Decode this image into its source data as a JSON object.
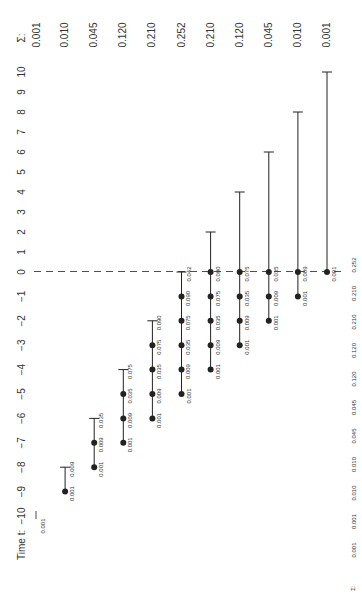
{
  "chart_data": {
    "type": "diagram",
    "title": "",
    "orientation": "rotated-90-ccw",
    "time_axis": {
      "label": "Time t:",
      "ticks": [
        -10,
        -9,
        -8,
        -7,
        -6,
        -5,
        -4,
        -3,
        -2,
        -1,
        0,
        1,
        2,
        3,
        4,
        5,
        6,
        7,
        8,
        9,
        10
      ]
    },
    "sigma_label": "Σ:",
    "sigma_top": [
      "0.001",
      "0.010",
      "0.045",
      "0.120",
      "0.210",
      "0.252",
      "0.210",
      "0.120",
      "0.045",
      "0.010",
      "0.001"
    ],
    "sigma_bottom": [
      "0.001",
      "0.001",
      "0.010",
      "0.010",
      "0.045",
      "0.045",
      "0.120",
      "0.120",
      "0.210",
      "0.210",
      "0.252"
    ],
    "reference_line": {
      "time": 0,
      "style": "dashed"
    },
    "columns": [
      {
        "index": 0,
        "start": -10,
        "dots": [],
        "cap": -10,
        "labels": [
          "0.001"
        ]
      },
      {
        "index": 1,
        "start": -9,
        "dots": [
          -9
        ],
        "cap": -8,
        "labels": [
          "0.001",
          "0.009"
        ]
      },
      {
        "index": 2,
        "start": -8,
        "dots": [
          -8,
          -7
        ],
        "cap": -6,
        "labels": [
          "0.001",
          "0.009",
          "0.035"
        ]
      },
      {
        "index": 3,
        "start": -7,
        "dots": [
          -7,
          -6,
          -5
        ],
        "cap": -4,
        "labels": [
          "0.001",
          "0.009",
          "0.035",
          "0.075"
        ]
      },
      {
        "index": 4,
        "start": -6,
        "dots": [
          -6,
          -5,
          -4,
          -3
        ],
        "cap": -2,
        "labels": [
          "0.001",
          "0.009",
          "0.035",
          "0.075",
          "0.090"
        ]
      },
      {
        "index": 5,
        "start": -5,
        "dots": [
          -5,
          -4,
          -3,
          -2,
          -1
        ],
        "cap": 0,
        "labels": [
          "0.001",
          "0.009",
          "0.035",
          "0.075",
          "0.090",
          "0.042"
        ]
      },
      {
        "index": 6,
        "start": -4,
        "dots": [
          -4,
          -3,
          -2,
          -1,
          0
        ],
        "cap": 2,
        "labels": [
          "0.001",
          "0.009",
          "0.035",
          "0.075",
          "0.090"
        ]
      },
      {
        "index": 7,
        "start": -3,
        "dots": [
          -3,
          -2,
          -1,
          0
        ],
        "cap": 4,
        "labels": [
          "0.001",
          "0.009",
          "0.035",
          "0.075"
        ]
      },
      {
        "index": 8,
        "start": -2,
        "dots": [
          -2,
          -1,
          0
        ],
        "cap": 6,
        "labels": [
          "0.001",
          "0.009",
          "0.035"
        ]
      },
      {
        "index": 9,
        "start": -1,
        "dots": [
          -1,
          0
        ],
        "cap": 8,
        "labels": [
          "0.001",
          "0.009"
        ]
      },
      {
        "index": 10,
        "start": 0,
        "dots": [
          0
        ],
        "cap": 10,
        "labels": [
          "0.001"
        ]
      }
    ],
    "colors": {
      "ink": "#222222",
      "text": "#333333",
      "background": "#ffffff"
    }
  }
}
